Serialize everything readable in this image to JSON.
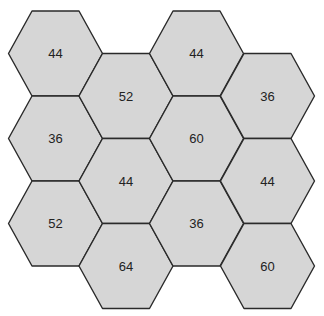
{
  "diagram": {
    "type": "hexagon-grid",
    "fill_color": "#d6d6d6",
    "stroke_color": "#2a2a2a",
    "columns": [
      {
        "cells": [
          {
            "value": "44"
          },
          {
            "value": "36"
          },
          {
            "value": "52"
          }
        ]
      },
      {
        "cells": [
          {
            "value": "52"
          },
          {
            "value": "44"
          },
          {
            "value": "64"
          }
        ]
      },
      {
        "cells": [
          {
            "value": "44"
          },
          {
            "value": "60"
          },
          {
            "value": "36"
          }
        ]
      },
      {
        "cells": [
          {
            "value": "36"
          },
          {
            "value": "44"
          },
          {
            "value": "60"
          }
        ]
      }
    ]
  }
}
